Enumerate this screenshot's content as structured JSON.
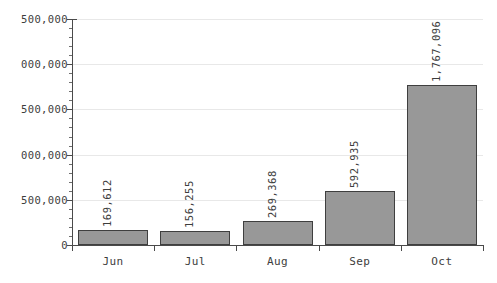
{
  "chart_data": {
    "type": "bar",
    "title": "",
    "subtitle": "",
    "xlabel": "",
    "ylabel": "",
    "categories": [
      "Jun",
      "Jul",
      "Aug",
      "Sep",
      "Oct"
    ],
    "values": [
      169612,
      156255,
      269368,
      592935,
      1767096
    ],
    "value_labels": [
      "169,612",
      "156,255",
      "269,368",
      "592,935",
      "1,767,096"
    ],
    "ylim": [
      0,
      2500000
    ],
    "y_ticks": [
      0,
      500000,
      1000000,
      1500000,
      2000000,
      2500000
    ],
    "y_tick_labels": [
      "0",
      "500,000",
      "000,000",
      "500,000",
      "000,000",
      "500,000"
    ],
    "y_minor_tick_step": 100000,
    "grid": true,
    "grid_axis": "y",
    "legend": null,
    "legend_position": "none",
    "series": [
      {
        "name": "",
        "values": [
          169612,
          156255,
          269368,
          592935,
          1767096
        ]
      }
    ],
    "colors": {
      "bar_fill": "#989898",
      "bar_border": "#3f3f3f",
      "gridline": "#e8e8e8",
      "axis": "#4a4a4a",
      "text": "#3d3d3d",
      "background": "#ffffff"
    }
  }
}
